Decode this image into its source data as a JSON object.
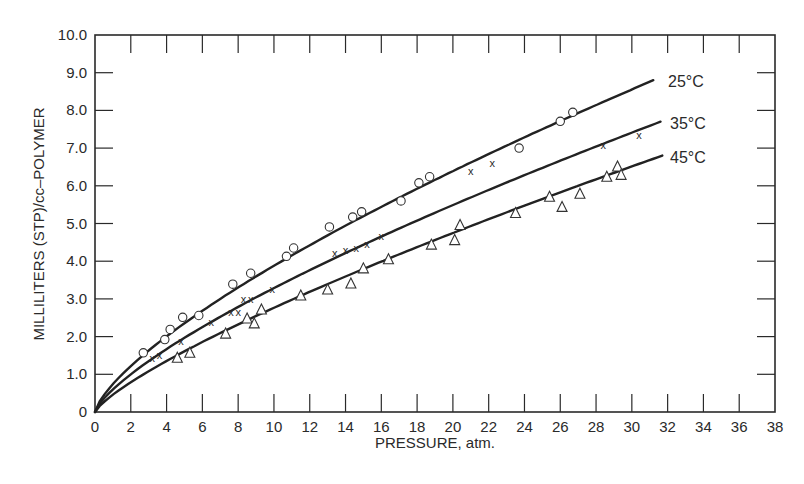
{
  "chart_data": {
    "type": "scatter",
    "title": "",
    "xlabel": "PRESSURE, atm.",
    "ylabel": "MILLILITERS (STP)/cc–POLYMER",
    "xlim": [
      0,
      38
    ],
    "ylim": [
      0,
      10
    ],
    "x_ticks": [
      0,
      2,
      4,
      6,
      8,
      10,
      12,
      14,
      16,
      18,
      20,
      22,
      24,
      26,
      28,
      30,
      32,
      34,
      36,
      38
    ],
    "x_tick_labels": [
      "0",
      "2",
      "4",
      "6",
      "8",
      "10",
      "12",
      "14",
      "16",
      "18",
      "20",
      "22",
      "24",
      "26",
      "28",
      "30",
      "32",
      "34",
      "36",
      "38"
    ],
    "y_ticks": [
      0,
      1,
      2,
      3,
      4,
      5,
      6,
      7,
      8,
      9,
      10
    ],
    "y_tick_labels": [
      "0",
      "1.0",
      "2.0",
      "3.0",
      "4.0",
      "5.0",
      "6.0",
      "7.0",
      "8.0",
      "9.0",
      "10.0"
    ],
    "grid": false,
    "legend": "inline labels at right end of each curve",
    "series": [
      {
        "name": "25°C",
        "marker": "circle",
        "curve_end": [
          31.2,
          8.8
        ],
        "points": [
          [
            2.7,
            1.57
          ],
          [
            3.9,
            1.92
          ],
          [
            4.2,
            2.19
          ],
          [
            4.9,
            2.51
          ],
          [
            5.8,
            2.56
          ],
          [
            7.7,
            3.39
          ],
          [
            8.7,
            3.68
          ],
          [
            10.7,
            4.13
          ],
          [
            11.1,
            4.35
          ],
          [
            13.1,
            4.91
          ],
          [
            14.4,
            5.17
          ],
          [
            14.9,
            5.31
          ],
          [
            17.1,
            5.6
          ],
          [
            18.1,
            6.08
          ],
          [
            18.7,
            6.24
          ],
          [
            23.7,
            7.0
          ],
          [
            26.0,
            7.71
          ],
          [
            26.7,
            7.95
          ]
        ]
      },
      {
        "name": "35°C",
        "marker": "x",
        "curve_end": [
          31.6,
          7.7
        ],
        "points": [
          [
            3.2,
            1.44
          ],
          [
            3.6,
            1.52
          ],
          [
            4.8,
            1.89
          ],
          [
            6.5,
            2.4
          ],
          [
            7.6,
            2.64
          ],
          [
            8.0,
            2.64
          ],
          [
            8.3,
            2.99
          ],
          [
            8.7,
            3.01
          ],
          [
            9.9,
            3.25
          ],
          [
            13.4,
            4.21
          ],
          [
            14.0,
            4.29
          ],
          [
            14.6,
            4.35
          ],
          [
            15.2,
            4.45
          ],
          [
            16.0,
            4.67
          ],
          [
            21.0,
            6.4
          ],
          [
            22.2,
            6.6
          ],
          [
            28.4,
            7.07
          ],
          [
            30.4,
            7.36
          ]
        ]
      },
      {
        "name": "45°C",
        "marker": "triangle",
        "curve_end": [
          31.7,
          6.8
        ],
        "points": [
          [
            4.6,
            1.44
          ],
          [
            5.3,
            1.57
          ],
          [
            7.3,
            2.08
          ],
          [
            8.5,
            2.48
          ],
          [
            8.9,
            2.35
          ],
          [
            9.3,
            2.72
          ],
          [
            11.5,
            3.09
          ],
          [
            13.0,
            3.25
          ],
          [
            14.3,
            3.41
          ],
          [
            15.0,
            3.81
          ],
          [
            16.4,
            4.05
          ],
          [
            18.8,
            4.44
          ],
          [
            20.1,
            4.56
          ],
          [
            20.4,
            4.96
          ],
          [
            23.5,
            5.28
          ],
          [
            25.4,
            5.71
          ],
          [
            26.1,
            5.44
          ],
          [
            27.1,
            5.79
          ],
          [
            28.6,
            6.24
          ],
          [
            29.2,
            6.51
          ],
          [
            29.4,
            6.29
          ]
        ]
      }
    ]
  },
  "labels": {
    "xlabel": "PRESSURE, atm.",
    "ylabel": "MILLILITERS (STP)/cc–POLYMER",
    "series_25": "25°C",
    "series_35": "35°C",
    "series_45": "45°C"
  }
}
